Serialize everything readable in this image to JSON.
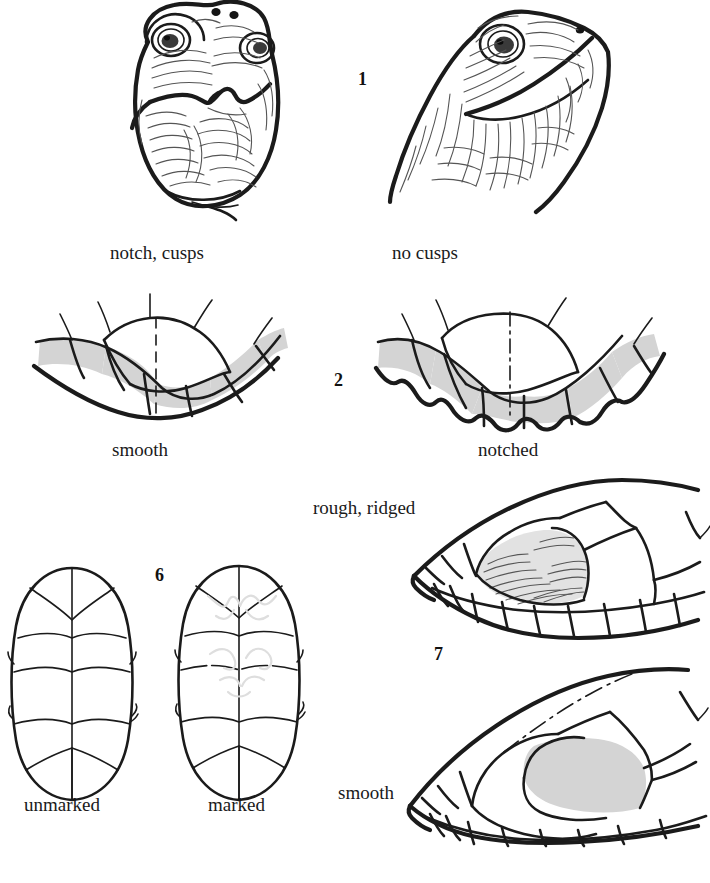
{
  "page": {
    "background_color": "#ffffff",
    "ink_color": "#1b1b1b",
    "shade_color": "#d4d4d4",
    "width": 710,
    "height": 883
  },
  "couplets": [
    {
      "number": "1",
      "topic": "upper jaw profile",
      "left": {
        "label": "notch, cusps",
        "figure": "turtle-head-front-notched"
      },
      "right": {
        "label": "no cusps",
        "figure": "turtle-head-oblique-plain"
      }
    },
    {
      "number": "2",
      "topic": "rear marginal scute edge",
      "left": {
        "label": "smooth",
        "figure": "marginal-scutes-smooth"
      },
      "right": {
        "label": "notched",
        "figure": "marginal-scutes-notched"
      }
    },
    {
      "number": "6",
      "topic": "plastron markings",
      "left": {
        "label": "unmarked",
        "figure": "plastron-unmarked"
      },
      "right": {
        "label": "marked",
        "figure": "plastron-marked"
      }
    },
    {
      "number": "7",
      "topic": "carapace surface texture",
      "top": {
        "label": "rough, ridged",
        "figure": "carapace-rough-ridged"
      },
      "bottom": {
        "label": "smooth",
        "figure": "carapace-smooth"
      }
    }
  ],
  "labels": {
    "notch_cusps": "notch, cusps",
    "no_cusps": "no cusps",
    "smooth_jaw": "smooth",
    "notched_jaw": "notched",
    "unmarked": "unmarked",
    "marked": "marked",
    "rough_ridged": "rough, ridged",
    "smooth_carapace": "smooth"
  },
  "numbers": {
    "one": "1",
    "two": "2",
    "six": "6",
    "seven": "7"
  }
}
